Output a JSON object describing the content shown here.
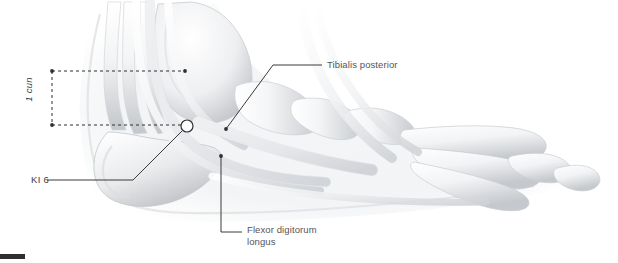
{
  "figure": {
    "width": 618,
    "height": 263,
    "background_color": "#ffffff"
  },
  "labels": {
    "acupoint": "KI 6",
    "measurement": "1 cun",
    "tendon_upper": "Tibialis posterior",
    "tendon_lower": "Flexor digitorum\nlongus",
    "tendon_lower_line1": "Flexor digitorum",
    "tendon_lower_line2": "longus"
  },
  "colors": {
    "text": "#555558",
    "text_dark": "#3c3c3f",
    "leader_line": "#3a3a3d",
    "dashed_line": "#2f2f31",
    "bone_light": "#fbfbfc",
    "bone_shadow": "#b9bcc0",
    "bone_mid": "#d9dbde",
    "silhouette": "#eceef0",
    "corner_bar": "#2f2f31",
    "marker_fill": "#ffffff",
    "marker_stroke": "#2f2f31"
  },
  "markers": {
    "acupoint_circle": {
      "cx": 187,
      "cy": 126,
      "r": 6
    },
    "dashed_top_dot_left": {
      "cx": 52,
      "cy": 71
    },
    "dashed_top_dot_right": {
      "cx": 185,
      "cy": 71
    },
    "dashed_bottom_dot_left": {
      "cx": 52,
      "cy": 125
    },
    "tibialis_dot": {
      "cx": 226,
      "cy": 129
    },
    "flexor_dot": {
      "cx": 221,
      "cy": 156
    }
  },
  "measurement": {
    "value": "1 cun",
    "top_y": 71,
    "bottom_y": 125,
    "left_x": 52,
    "right_x": 185
  }
}
